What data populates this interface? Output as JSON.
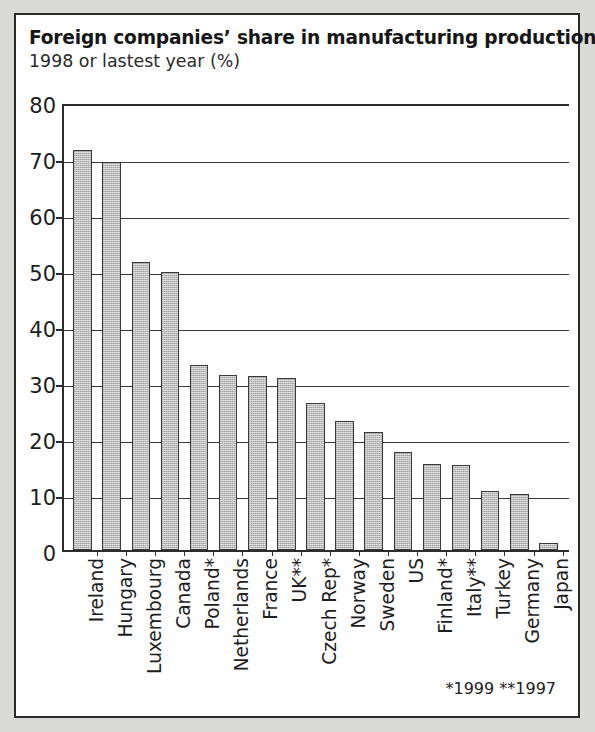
{
  "figure": {
    "title": "Foreign companies’ share in manufacturing production",
    "subtitle": "1998 or lastest year (%)",
    "footnote": "*1999 **1997",
    "panel_background": "#ffffff",
    "page_background": "#d9d9d7",
    "border_color": "#2b2b2b",
    "bar_fill": "#bcbcbc",
    "bar_border": "#3a3a3a",
    "gridline_color": "#3b3b3b"
  },
  "chart_data": {
    "type": "bar",
    "title": "Foreign companies’ share in manufacturing production",
    "subtitle": "1998 or lastest year (%)",
    "xlabel": "",
    "ylabel": "",
    "ylim": [
      0,
      80
    ],
    "yticks": [
      0,
      10,
      20,
      30,
      40,
      50,
      60,
      70,
      80
    ],
    "grid": true,
    "legend": false,
    "orientation": "vertical",
    "annotations": [
      "*1999",
      "**1997"
    ],
    "categories": [
      "Ireland",
      "Hungary",
      "Luxembourg",
      "Canada",
      "Poland*",
      "Netherlands",
      "France",
      "UK**",
      "Czech Rep*",
      "Norway",
      "Sweden",
      "US",
      "Finland*",
      "Italy**",
      "Turkey",
      "Germany",
      "Japan"
    ],
    "values": [
      71.5,
      69.3,
      51.5,
      49.7,
      33.0,
      31.3,
      31.0,
      30.7,
      26.3,
      23.0,
      21.0,
      17.5,
      15.4,
      15.2,
      10.6,
      10.0,
      1.2
    ]
  }
}
